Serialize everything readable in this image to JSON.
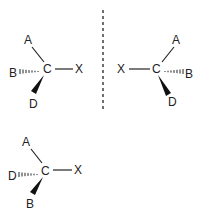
{
  "figure": {
    "mirror_plane": {
      "style": "dashed-vertical"
    },
    "molecules": [
      {
        "id": "left",
        "center": "C",
        "substituents": {
          "up_left": "A",
          "right": "X",
          "hashed_left": "B",
          "wedge_down": "D"
        }
      },
      {
        "id": "mirror-image",
        "center": "C",
        "substituents": {
          "up_right": "A",
          "left": "X",
          "hashed_right": "B",
          "wedge_down": "D"
        }
      },
      {
        "id": "bottom",
        "center": "C",
        "substituents": {
          "up_left": "A",
          "right": "X",
          "hashed_left": "D",
          "wedge_down": "B"
        }
      }
    ]
  }
}
